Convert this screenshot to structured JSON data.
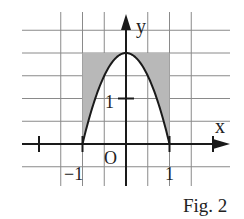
{
  "figure": {
    "caption": "Fig. 2",
    "function": "y = 2 - 2x^2",
    "axis_labels": {
      "x": "x",
      "y": "y"
    },
    "origin_label": "O",
    "tick_labels": {
      "x_neg": "−1",
      "x_pos": "1",
      "y_pos": "1"
    },
    "grid_x_range": [
      -2,
      2
    ],
    "grid_y_range": [
      -0.5,
      2.5
    ],
    "grid_step": 0.5,
    "shaded_rectangle": {
      "x_from": -1,
      "x_to": 1,
      "y_from": 0,
      "y_to": 2
    },
    "shaded_region": "area inside rectangle [-1,1]x[0,2] above the parabola",
    "colors": {
      "shade": "#b8b8b8",
      "grid": "#8a8a8a",
      "ink": "#1a1a1a"
    }
  }
}
